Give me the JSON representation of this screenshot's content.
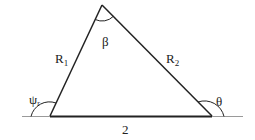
{
  "diagram": {
    "type": "triangle",
    "colors": {
      "stroke": "#222222",
      "baseline": "#9a9a9a",
      "background": "#ffffff"
    },
    "vertices": {
      "left": [
        50,
        116
      ],
      "top": [
        102,
        5
      ],
      "right": [
        212,
        116
      ]
    },
    "labels": {
      "left_side": "R",
      "left_side_sub": "1",
      "right_side": "R",
      "right_side_sub": "2",
      "base": "2",
      "top_angle": "β",
      "left_angle": "ψ",
      "left_angle_sub": "r",
      "right_angle": "θ"
    }
  }
}
